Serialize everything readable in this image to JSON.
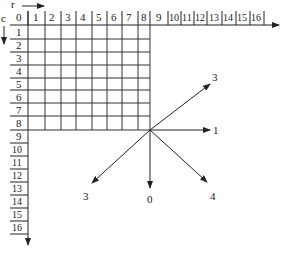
{
  "axes": {
    "row_axis_label": "r",
    "col_axis_label": "c",
    "origin_label": "0",
    "top_labels": [
      "1",
      "2",
      "3",
      "4",
      "5",
      "6",
      "7",
      "8",
      "9",
      "10",
      "11",
      "12",
      "13",
      "14",
      "15",
      "16"
    ],
    "left_labels": [
      "1",
      "2",
      "3",
      "4",
      "5",
      "6",
      "7",
      "8",
      "9",
      "10",
      "11",
      "12",
      "13",
      "14",
      "15",
      "16"
    ]
  },
  "grid": {
    "cols": 8,
    "rows": 8,
    "line_color": "#333333"
  },
  "directions": [
    {
      "label": "1",
      "angle_deg": 0
    },
    {
      "label": "3",
      "angle_deg": 45
    },
    {
      "label": "0",
      "angle_deg": -90
    },
    {
      "label": "4",
      "angle_deg": -45
    },
    {
      "label": "3",
      "angle_deg": -135
    }
  ]
}
